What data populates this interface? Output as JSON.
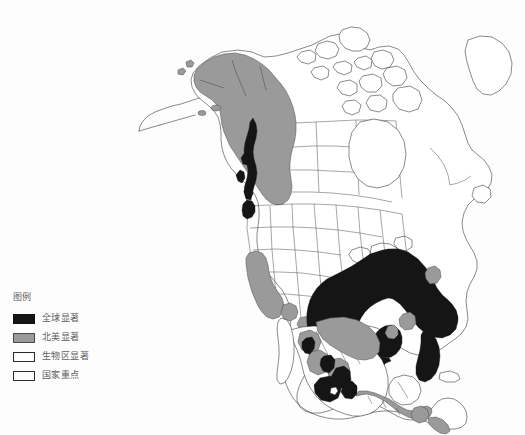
{
  "figure": {
    "caption": "图 3.9  保育的生态区进化现状"
  },
  "legend": {
    "title": "图例",
    "items": [
      {
        "label": "全球显著",
        "color": "#151515",
        "border": "#111111"
      },
      {
        "label": "北美显著",
        "color": "#9a9a9a",
        "border": "#4a4a4a"
      },
      {
        "label": "生物区显著",
        "color": "#ffffff",
        "border": "#2b2b2b"
      },
      {
        "label": "国家重点",
        "color": "#ffffff",
        "border": "#2b2b2b"
      }
    ]
  },
  "map": {
    "name": "north-america-ecoregion-conservation-status",
    "background": "#fdfdfd",
    "outline_color": "#2a2a2a",
    "colors": {
      "globally_significant": "#151515",
      "north_america_significant": "#9a9a9a",
      "bioregion_significant": "#ffffff",
      "national_priority": "#ffffff"
    },
    "regions": [
      {
        "name": "alaska",
        "class": "north_america_significant"
      },
      {
        "name": "southeast-alaska-panhandle",
        "class": "globally_significant"
      },
      {
        "name": "pacific-northwest-coast",
        "class": "globally_significant"
      },
      {
        "name": "california",
        "class": "north_america_significant"
      },
      {
        "name": "canadian-arctic-archipelago",
        "class": "bioregion_significant"
      },
      {
        "name": "central-canada",
        "class": "bioregion_significant"
      },
      {
        "name": "eastern-canada",
        "class": "bioregion_significant"
      },
      {
        "name": "great-plains",
        "class": "bioregion_significant"
      },
      {
        "name": "southeastern-united-states",
        "class": "globally_significant"
      },
      {
        "name": "gulf-coast",
        "class": "globally_significant"
      },
      {
        "name": "florida-peninsula",
        "class": "globally_significant"
      },
      {
        "name": "appalachian-piedmont",
        "class": "north_america_significant"
      },
      {
        "name": "northern-mexico",
        "class": "north_america_significant"
      },
      {
        "name": "sierra-madre-occidental",
        "class": "north_america_significant"
      },
      {
        "name": "sierra-madre-oriental",
        "class": "globally_significant"
      },
      {
        "name": "central-mexico-highlands",
        "class": "globally_significant"
      },
      {
        "name": "southern-mexico",
        "class": "globally_significant"
      },
      {
        "name": "yucatan-peninsula",
        "class": "bioregion_significant"
      },
      {
        "name": "central-america",
        "class": "north_america_significant"
      },
      {
        "name": "baja-california",
        "class": "bioregion_significant"
      }
    ]
  }
}
